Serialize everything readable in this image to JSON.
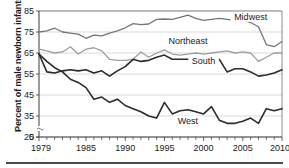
{
  "chart_data": {
    "type": "line",
    "title": "",
    "xlabel": "",
    "ylabel": "Percent of male newborn infants",
    "xlim": [
      1979,
      2010
    ],
    "ylim": [
      25,
      85
    ],
    "y_axis_break": true,
    "y_zero_shown": true,
    "grid": true,
    "grid_axis": "y",
    "legend_position": "inline-annotations",
    "ytick_labels": [
      "0",
      "25",
      "35",
      "45",
      "55",
      "65",
      "75",
      "85"
    ],
    "ytick_values": [
      0,
      25,
      35,
      45,
      55,
      65,
      75,
      85
    ],
    "xtick_labels": [
      "1979",
      "1985",
      "1990",
      "1995",
      "2000",
      "2005",
      "2010"
    ],
    "xtick_values": [
      1979,
      1985,
      1990,
      1995,
      2000,
      2005,
      2010
    ],
    "x": [
      1979,
      1980,
      1981,
      1982,
      1983,
      1984,
      1985,
      1986,
      1987,
      1988,
      1989,
      1990,
      1991,
      1992,
      1993,
      1994,
      1995,
      1996,
      1997,
      1998,
      1999,
      2000,
      2001,
      2002,
      2003,
      2004,
      2005,
      2006,
      2007,
      2008,
      2009,
      2010
    ],
    "series": [
      {
        "name": "Midwest",
        "color": "#767676",
        "width": 1.3,
        "label_x": 2006,
        "label_y": 81.5,
        "values": [
          75.0,
          75.5,
          76.8,
          75.0,
          74.5,
          74.0,
          72.0,
          73.5,
          73.2,
          74.5,
          75.5,
          77.0,
          79.0,
          78.5,
          78.8,
          81.0,
          81.2,
          81.0,
          82.0,
          83.0,
          81.5,
          80.5,
          81.0,
          81.5,
          81.0,
          80.5,
          80.8,
          79.5,
          77.5,
          69.0,
          68.0,
          70.5
        ]
      },
      {
        "name": "Northeast",
        "color": "#9e9e9e",
        "width": 1.3,
        "label_x": 1998,
        "label_y": 70.0,
        "values": [
          66.8,
          66.0,
          65.0,
          65.5,
          68.0,
          64.5,
          66.8,
          67.5,
          66.0,
          62.0,
          61.5,
          61.5,
          62.0,
          65.5,
          63.0,
          65.0,
          66.5,
          64.5,
          64.0,
          64.5,
          65.0,
          64.5,
          65.0,
          65.5,
          66.0,
          65.0,
          65.5,
          65.0,
          61.0,
          63.0,
          65.0,
          65.0
        ]
      },
      {
        "name": "South",
        "color": "#2b2b2b",
        "width": 1.6,
        "label_x": 2000,
        "label_y": 60.5,
        "values": [
          64.5,
          56.0,
          55.5,
          56.5,
          57.0,
          56.5,
          57.0,
          55.5,
          56.5,
          54.0,
          56.5,
          58.5,
          62.0,
          61.0,
          61.5,
          63.0,
          64.0,
          62.0,
          62.0,
          62.0,
          61.5,
          61.0,
          62.5,
          62.0,
          56.0,
          57.5,
          57.5,
          56.0,
          54.0,
          54.5,
          55.5,
          57.0
        ]
      },
      {
        "name": "West",
        "color": "#2b2b2b",
        "width": 1.6,
        "label_x": 1998,
        "label_y": 32.0,
        "values": [
          64.5,
          61.0,
          58.0,
          56.0,
          52.5,
          51.0,
          48.5,
          43.0,
          44.0,
          41.5,
          43.0,
          40.0,
          38.5,
          37.0,
          35.0,
          34.0,
          41.5,
          36.0,
          37.5,
          38.0,
          37.0,
          36.0,
          39.5,
          33.0,
          31.5,
          31.5,
          32.5,
          34.0,
          31.5,
          38.5,
          37.5,
          38.5
        ]
      }
    ]
  }
}
